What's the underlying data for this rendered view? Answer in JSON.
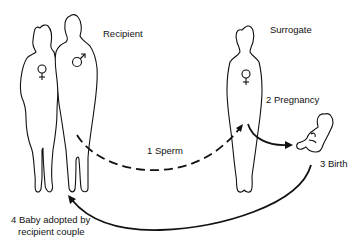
{
  "diagram": {
    "labels": {
      "recipient": "Recipient",
      "surrogate": "Surrogate",
      "step1": "1 Sperm",
      "step2": "2 Pregnancy",
      "step3": "3 Birth",
      "step4_line1": "4 Baby adopted by",
      "step4_line2": "recipient couple"
    },
    "symbols": {
      "female": "♀",
      "male": "♂"
    },
    "icons": [
      "female-silhouette",
      "male-silhouette",
      "surrogate-silhouette",
      "baby-figure"
    ]
  }
}
